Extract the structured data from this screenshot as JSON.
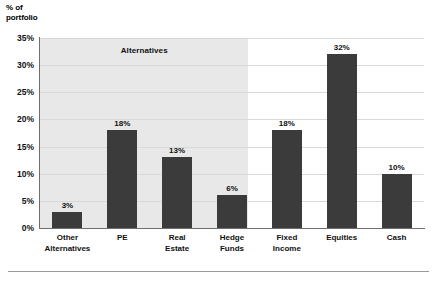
{
  "axis_title": "% of\nportfolio",
  "annotation": {
    "label": "Alternatives",
    "covers_categories": [
      "Other Alternatives",
      "PE",
      "Real Estate",
      "Hedge Funds"
    ]
  },
  "colors": {
    "bar": "#3b3b3b",
    "shaded_band": "#e8e8e8",
    "gridline": "#d9d9d9",
    "axis": "#6e6e6e",
    "background": "#ffffff",
    "text": "#111111"
  },
  "chart_data": {
    "type": "bar",
    "title": "",
    "subtitle": "",
    "xlabel": "",
    "ylabel": "% of portfolio",
    "categories": [
      "Other Alternatives",
      "PE",
      "Real Estate",
      "Hedge Funds",
      "Fixed Income",
      "Equities",
      "Cash"
    ],
    "category_lines": [
      [
        "Other",
        "Alternatives"
      ],
      [
        "PE"
      ],
      [
        "Real",
        "Estate"
      ],
      [
        "Hedge",
        "Funds"
      ],
      [
        "Fixed",
        "Income"
      ],
      [
        "Equities"
      ],
      [
        "Cash"
      ]
    ],
    "values": [
      3,
      18,
      13,
      6,
      18,
      32,
      10
    ],
    "data_labels": [
      "3%",
      "18%",
      "13%",
      "6%",
      "18%",
      "32%",
      "10%"
    ],
    "ylim": [
      0,
      35
    ],
    "ytick_values": [
      0,
      5,
      10,
      15,
      20,
      25,
      30,
      35
    ],
    "ytick_labels": [
      "0%",
      "5%",
      "10%",
      "15%",
      "20%",
      "25%",
      "30%",
      "35%"
    ],
    "grid": true,
    "legend": "none",
    "annotations": [
      {
        "text": "Alternatives",
        "spans_categories": [
          "Other Alternatives",
          "PE",
          "Real Estate",
          "Hedge Funds"
        ]
      }
    ]
  }
}
